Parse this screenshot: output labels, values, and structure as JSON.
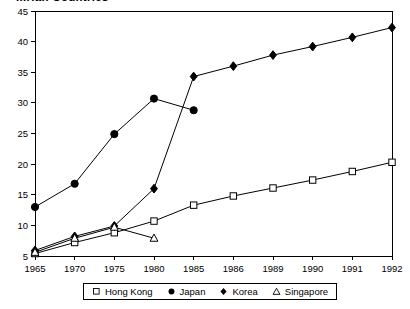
{
  "chart": {
    "title": "...rian Countries",
    "frame": {
      "x": 35,
      "y": 11,
      "width": 357,
      "height": 245
    }
  },
  "chart_data": {
    "type": "line",
    "title": "...rian Countries",
    "xlabel": "",
    "ylabel": "",
    "ylim": [
      5,
      45
    ],
    "ytick_step": 5,
    "yticks": [
      5,
      10,
      15,
      20,
      25,
      30,
      35,
      40,
      45
    ],
    "grid": false,
    "legend_position": "bottom",
    "x_is_categorical": true,
    "categories": [
      "1965",
      "1970",
      "1975",
      "1980",
      "1985",
      "1986",
      "1989",
      "1990",
      "1991",
      "1992"
    ],
    "series": [
      {
        "name": "Hong Kong",
        "marker": "open-square",
        "values": [
          5.4,
          7.2,
          8.8,
          10.7,
          13.3,
          14.8,
          16.1,
          17.4,
          18.8,
          20.3
        ]
      },
      {
        "name": "Japan",
        "marker": "filled-circle",
        "values": [
          13.0,
          16.8,
          24.9,
          30.7,
          28.8,
          null,
          null,
          null,
          null,
          null
        ]
      },
      {
        "name": "Korea",
        "marker": "filled-diamond",
        "values": [
          5.9,
          8.2,
          9.9,
          16.0,
          34.3,
          36.0,
          37.8,
          39.2,
          40.7,
          42.3
        ]
      },
      {
        "name": "Singapore",
        "marker": "open-triangle",
        "values": [
          5.6,
          7.9,
          9.7,
          7.9,
          null,
          null,
          null,
          null,
          null,
          null
        ]
      }
    ]
  },
  "colors": {
    "line": "#000000",
    "axis": "#000000",
    "background": "#ffffff",
    "marker_fill_open": "#ffffff"
  },
  "legend": {
    "items": [
      {
        "label": "Hong Kong",
        "marker": "open-square"
      },
      {
        "label": "Japan",
        "marker": "filled-circle"
      },
      {
        "label": "Korea",
        "marker": "filled-diamond"
      },
      {
        "label": "Singapore",
        "marker": "open-triangle"
      }
    ]
  }
}
